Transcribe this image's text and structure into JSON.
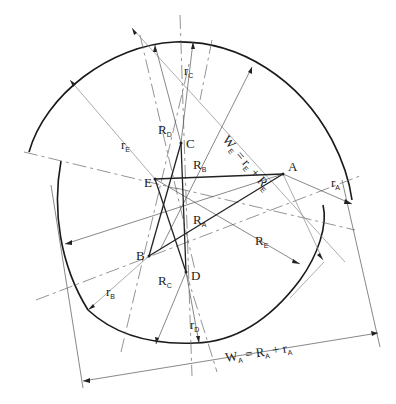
{
  "diagram": {
    "type": "cam-profile-construction",
    "points": [
      {
        "id": "A",
        "label": "A",
        "x": 283,
        "y": 174
      },
      {
        "id": "B",
        "label": "B",
        "x": 149,
        "y": 256
      },
      {
        "id": "C",
        "label": "C",
        "x": 181,
        "y": 143
      },
      {
        "id": "D",
        "label": "D",
        "x": 186,
        "y": 272
      },
      {
        "id": "E",
        "label": "E",
        "x": 155,
        "y": 179
      }
    ],
    "labels": {
      "rA": {
        "main": "r",
        "sub": "A"
      },
      "rB": {
        "main": "r",
        "sub": "B"
      },
      "rC": {
        "main": "r",
        "sub": "C"
      },
      "rD": {
        "main": "r",
        "sub": "D"
      },
      "rE": {
        "main": "r",
        "sub": "E"
      },
      "RA": {
        "main": "R",
        "sub": "A"
      },
      "RB": {
        "main": "R",
        "sub": "B"
      },
      "RC": {
        "main": "R",
        "sub": "C"
      },
      "RD": {
        "main": "R",
        "sub": "D"
      },
      "RE": {
        "main": "R",
        "sub": "E"
      }
    },
    "formulas": {
      "WE": {
        "text": "W",
        "sub1": "E",
        "eq": " = r",
        "sub2": "E",
        "plus": " + R",
        "sub3": "E"
      },
      "WA": {
        "text": "W",
        "sub1": "A",
        "eq": " = R",
        "sub2": "A",
        "plus": " + r",
        "sub3": "A"
      }
    }
  }
}
